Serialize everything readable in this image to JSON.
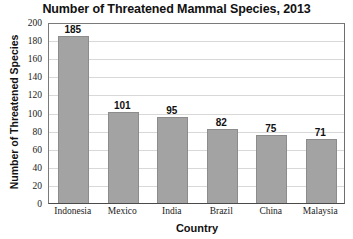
{
  "chart_data": {
    "type": "bar",
    "title": "Number of Threatened Mammal Species, 2013",
    "xlabel": "Country",
    "ylabel": "Number of Threatened Species",
    "categories": [
      "Indonesia",
      "Mexico",
      "India",
      "Brazil",
      "China",
      "Malaysia"
    ],
    "values": [
      185,
      101,
      95,
      82,
      75,
      71
    ],
    "ylim": [
      0,
      200
    ],
    "ytick_step": 20,
    "yticks": [
      200,
      180,
      160,
      140,
      120,
      100,
      80,
      60,
      40,
      20,
      0
    ],
    "grid": true,
    "grid_axis": "y",
    "legend": false,
    "legend_position": "none",
    "bar_color": "#a3a3a3",
    "bar_border_color": "#8c8c8c",
    "gridline_color": "#d8d8d8",
    "axis_color": "#4a4a4a",
    "text_color": "#111111",
    "background": "#ffffff",
    "data_labels": [
      "185",
      "101",
      "95",
      "82",
      "75",
      "71"
    ]
  }
}
